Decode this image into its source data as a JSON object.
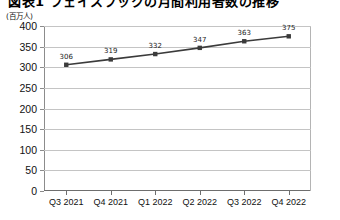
{
  "chart_data": {
    "type": "line",
    "title": "図表1 フェイスブックの月間利用者数の推移",
    "unit_label": "(百万人)",
    "categories": [
      "Q3 2021",
      "Q4 2021",
      "Q1 2022",
      "Q2 2022",
      "Q3 2022",
      "Q4 2022"
    ],
    "values": [
      306,
      319,
      332,
      347,
      363,
      375
    ],
    "point_labels": [
      "306",
      "319",
      "332",
      "347",
      "363",
      "375"
    ],
    "xlabel": "",
    "ylabel": "",
    "ylim": [
      0,
      400
    ],
    "yticks": [
      0,
      50,
      100,
      150,
      200,
      250,
      300,
      350,
      400
    ],
    "ytick_labels": [
      "0",
      "50",
      "100",
      "150",
      "200",
      "250",
      "300",
      "350",
      "400"
    ],
    "grid": true,
    "legend": false,
    "series_color": "#3b3b3b",
    "marker_color": "#3b3b3b",
    "gridline_color": "#c4c4c4",
    "axis_color": "#6e6e6e",
    "background_color": "#ffffff"
  }
}
